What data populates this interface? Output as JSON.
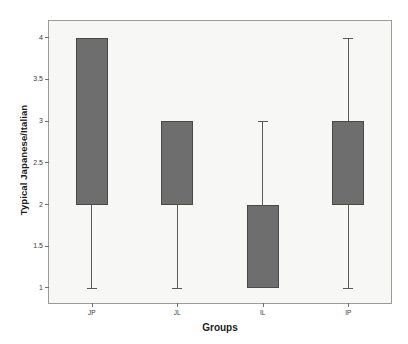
{
  "chart_data": {
    "type": "bar",
    "title": "",
    "xlabel": "Groups",
    "ylabel": "Typical Japanese/Italian",
    "categories": [
      "JP",
      "JL",
      "IL",
      "IP"
    ],
    "ylim": [
      0.82,
      4.2
    ],
    "yticks": [
      1,
      1.5,
      2,
      2.5,
      3,
      3.5,
      4
    ],
    "ytick_labels": [
      "1",
      "1.5",
      "2",
      "2.5",
      "3",
      "3.5",
      "4"
    ],
    "grid": false,
    "legend": "none",
    "box_color": "#6e6e6e",
    "plot_background": "#f7f7f5",
    "series": [
      {
        "name": "JP",
        "box_low": 2,
        "box_high": 4,
        "whisker_low": 1,
        "whisker_high": null
      },
      {
        "name": "JL",
        "box_low": 2,
        "box_high": 3,
        "whisker_low": 1,
        "whisker_high": null
      },
      {
        "name": "IL",
        "box_low": 1,
        "box_high": 2,
        "whisker_low": null,
        "whisker_high": 3
      },
      {
        "name": "IP",
        "box_low": 2,
        "box_high": 3,
        "whisker_low": 1,
        "whisker_high": 4
      }
    ]
  }
}
